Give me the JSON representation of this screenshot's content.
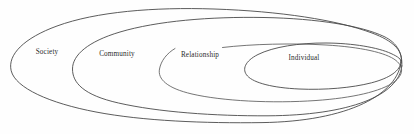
{
  "diagram": {
    "type": "nested-ellipses",
    "title": "",
    "background_color": "#fefefe",
    "stroke_color": "#4a4a4a",
    "label_color": "#2b2b2b",
    "rings": [
      {
        "id": "society",
        "label": "Society",
        "level": 1,
        "label_x": 47,
        "label_y": 52,
        "cx": 205,
        "cy": 65,
        "rx": 196,
        "ry": 55,
        "rotation": -1.5,
        "closed": true
      },
      {
        "id": "community",
        "label": "Community",
        "level": 2,
        "label_x": 117,
        "label_y": 54,
        "cx": 237,
        "cy": 66,
        "rx": 165,
        "ry": 49,
        "rotation": -1.5,
        "closed": true
      },
      {
        "id": "relationship",
        "label": "Relationship",
        "level": 3,
        "label_x": 200,
        "label_y": 55,
        "cx": 281,
        "cy": 66,
        "rx": 122,
        "ry": 41,
        "rotation": -2,
        "closed": false
      },
      {
        "id": "individual",
        "label": "Individual",
        "level": 4,
        "label_x": 304,
        "label_y": 58,
        "cx": 324,
        "cy": 63,
        "rx": 78,
        "ry": 27,
        "rotation": -2,
        "closed": true
      }
    ]
  }
}
